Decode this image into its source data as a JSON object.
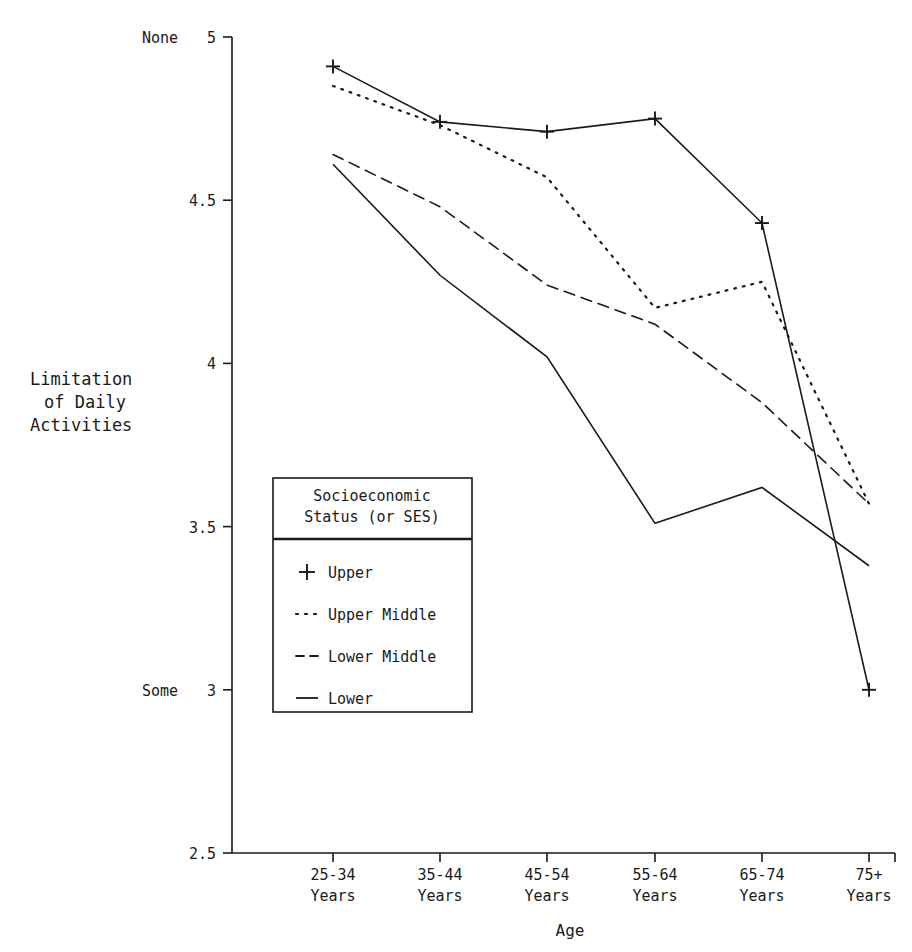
{
  "chart_data": {
    "type": "line",
    "title": "",
    "xlabel": "Age",
    "ylabel": "Limitation of Daily Activities",
    "categories": [
      "25-34 Years",
      "35-44 Years",
      "45-54 Years",
      "55-64 Years",
      "65-74 Years",
      "75+ Years"
    ],
    "category_lines": [
      [
        "25-34",
        "Years"
      ],
      [
        "35-44",
        "Years"
      ],
      [
        "45-54",
        "Years"
      ],
      [
        "55-64",
        "Years"
      ],
      [
        "65-74",
        "Years"
      ],
      [
        "75+",
        "Years"
      ]
    ],
    "ylim": [
      2.5,
      5
    ],
    "yticks": [
      5,
      4.5,
      4,
      3.5,
      3,
      2.5
    ],
    "ytick_labels": [
      "5",
      "4.5",
      "4",
      "3.5",
      "3",
      "2.5"
    ],
    "y_anchor_labels": [
      {
        "value": 5,
        "label": "None"
      },
      {
        "value": 3,
        "label": "Some"
      }
    ],
    "grid": false,
    "legend_position": "inside-left-center",
    "legend_title_lines": [
      "Socioeconomic",
      "Status (or SES)"
    ],
    "series": [
      {
        "name": "Upper",
        "style": "solid-plus",
        "marker": "+",
        "values": [
          4.91,
          4.74,
          4.71,
          4.75,
          4.43,
          3.0
        ]
      },
      {
        "name": "Upper Middle",
        "style": "dotted",
        "marker": "none",
        "values": [
          4.85,
          4.73,
          4.57,
          4.17,
          4.25,
          3.57
        ]
      },
      {
        "name": "Lower Middle",
        "style": "dashed",
        "marker": "none",
        "values": [
          4.64,
          4.48,
          4.24,
          4.12,
          3.88,
          3.57
        ]
      },
      {
        "name": "Lower",
        "style": "solid",
        "marker": "none",
        "values": [
          4.61,
          4.27,
          4.02,
          3.51,
          3.62,
          3.38
        ]
      }
    ]
  },
  "axis": {
    "y_label_line1": "Limitation",
    "y_label_line2": "of Daily",
    "y_label_line3": "Activities",
    "x_label": "Age"
  },
  "legend": {
    "title_line1": "Socioeconomic",
    "title_line2": "Status (or SES)",
    "items": [
      {
        "label": "Upper",
        "glyph": "+"
      },
      {
        "label": "Upper Middle",
        "glyph": "··"
      },
      {
        "label": "Lower Middle",
        "glyph": "--"
      },
      {
        "label": "Lower",
        "glyph": "—"
      }
    ]
  },
  "colors": {
    "ink": "#1a1a1a",
    "background": "#ffffff"
  }
}
